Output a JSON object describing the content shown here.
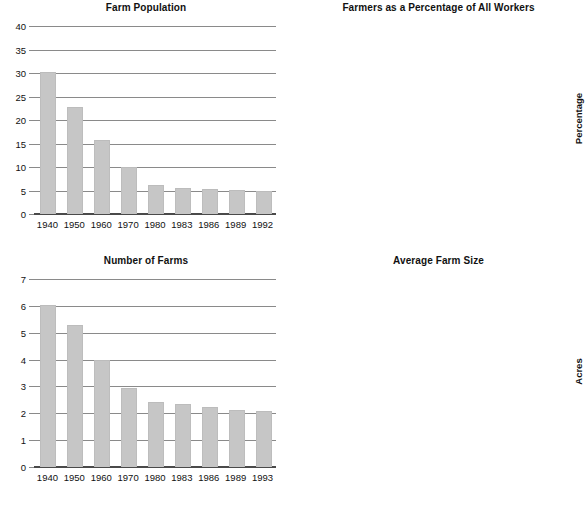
{
  "page": {
    "background": "#ffffff",
    "bar_color": "#c6c6c6",
    "gridline_color": "#8a8a8a",
    "axis_color": "#4a4a4a",
    "text_color": "#111111"
  },
  "chart_data": [
    {
      "id": "farm-population",
      "type": "bar",
      "title": "Farm Population",
      "xlabel": "",
      "ylabel": "Millions",
      "categories": [
        "1940",
        "1950",
        "1960",
        "1970",
        "1980",
        "1983",
        "1986",
        "1989",
        "1992"
      ],
      "values": [
        30.0,
        22.5,
        15.6,
        9.7,
        6.0,
        5.4,
        5.2,
        4.8,
        4.6
      ],
      "yticks": [
        0,
        5,
        10,
        15,
        20,
        25,
        30,
        35,
        40
      ],
      "ytick_labels": [
        "0",
        "5",
        "10",
        "15",
        "20",
        "25",
        "30",
        "35",
        "40"
      ],
      "ylim": [
        0,
        40
      ],
      "grid": true,
      "legend": "none"
    },
    {
      "id": "farmers-percentage",
      "type": "bar",
      "title": "Farmers as a Percentage of All Workers",
      "xlabel": "",
      "ylabel": "Percentage",
      "categories": [
        "1940",
        "1950",
        "1960",
        "1970",
        "1980",
        "1990",
        "1992"
      ],
      "values": [
        17.4,
        11.3,
        6.6,
        3.9,
        2.8,
        2.4,
        2.6
      ],
      "yticks": [
        0,
        4,
        8,
        12,
        16,
        20
      ],
      "ytick_labels": [
        "0",
        "4",
        "8",
        "12",
        "16",
        "20"
      ],
      "ylim": [
        0,
        20
      ],
      "grid": true,
      "legend": "none"
    },
    {
      "id": "number-of-farms",
      "type": "bar",
      "title": "Number of Farms",
      "xlabel": "",
      "ylabel": "Millions",
      "categories": [
        "1940",
        "1950",
        "1960",
        "1970",
        "1980",
        "1983",
        "1986",
        "1989",
        "1993"
      ],
      "values": [
        6.0,
        5.25,
        3.95,
        2.9,
        2.4,
        2.3,
        2.2,
        2.1,
        2.05
      ],
      "yticks": [
        0,
        1,
        2,
        3,
        4,
        5,
        6,
        7
      ],
      "ytick_labels": [
        "0",
        "1",
        "2",
        "3",
        "4",
        "5",
        "6",
        "7"
      ],
      "ylim": [
        0,
        7
      ],
      "grid": true,
      "legend": "none"
    },
    {
      "id": "average-farm-size",
      "type": "bar",
      "title": "Average Farm Size",
      "xlabel": "",
      "ylabel": "Acres",
      "categories": [
        "1940",
        "1950",
        "1960",
        "1970",
        "1980",
        "1983",
        "1986",
        "1989",
        "1993"
      ],
      "values": [
        175,
        215,
        300,
        375,
        430,
        435,
        455,
        455,
        475
      ],
      "yticks": [
        0,
        100,
        200,
        300,
        400,
        500
      ],
      "ytick_labels": [
        "0",
        "100",
        "200",
        "300",
        "400",
        "500"
      ],
      "ylim": [
        0,
        500
      ],
      "grid": true,
      "legend": "none"
    }
  ]
}
